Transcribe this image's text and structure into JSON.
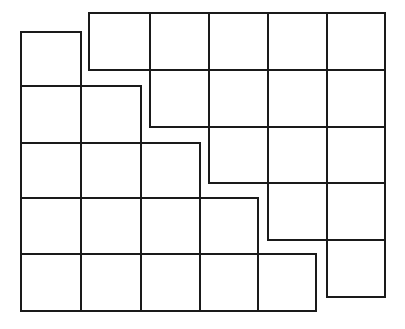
{
  "figure": {
    "kind": "staircase-grid-diagram",
    "width": 405,
    "height": 329,
    "background_color": "#ffffff",
    "stroke_color": "#1a1a1a",
    "stroke_width": 2.6,
    "cell_fill": "#ffffff",
    "row_count": 5,
    "column_count": 6,
    "cell_count": 30,
    "lower_block": {
      "name": "lower-left-staircase-block",
      "cells_per_row": [
        1,
        2,
        3,
        4,
        5
      ],
      "column_x_edges": [
        21,
        81,
        141,
        200,
        258,
        316
      ],
      "row_y_edges": [
        32,
        86,
        143,
        198,
        254,
        311
      ]
    },
    "upper_block": {
      "name": "upper-right-staircase-block",
      "cells_per_row": [
        5,
        4,
        3,
        2,
        1
      ],
      "column_x_edges": [
        89,
        150,
        209,
        268,
        327,
        385
      ],
      "row_y_edges": [
        13,
        70,
        127,
        183,
        240,
        297
      ]
    },
    "cells": [
      {
        "id": "lower-r1-c1",
        "block": "lower",
        "row": 1,
        "col": 1,
        "x": 21,
        "y": 32,
        "w": 60,
        "h": 54
      },
      {
        "id": "lower-r2-c1",
        "block": "lower",
        "row": 2,
        "col": 1,
        "x": 21,
        "y": 86,
        "w": 60,
        "h": 57
      },
      {
        "id": "lower-r2-c2",
        "block": "lower",
        "row": 2,
        "col": 2,
        "x": 81,
        "y": 86,
        "w": 60,
        "h": 57
      },
      {
        "id": "lower-r3-c1",
        "block": "lower",
        "row": 3,
        "col": 1,
        "x": 21,
        "y": 143,
        "w": 60,
        "h": 55
      },
      {
        "id": "lower-r3-c2",
        "block": "lower",
        "row": 3,
        "col": 2,
        "x": 81,
        "y": 143,
        "w": 60,
        "h": 55
      },
      {
        "id": "lower-r3-c3",
        "block": "lower",
        "row": 3,
        "col": 3,
        "x": 141,
        "y": 143,
        "w": 59,
        "h": 55
      },
      {
        "id": "lower-r4-c1",
        "block": "lower",
        "row": 4,
        "col": 1,
        "x": 21,
        "y": 198,
        "w": 60,
        "h": 56
      },
      {
        "id": "lower-r4-c2",
        "block": "lower",
        "row": 4,
        "col": 2,
        "x": 81,
        "y": 198,
        "w": 60,
        "h": 56
      },
      {
        "id": "lower-r4-c3",
        "block": "lower",
        "row": 4,
        "col": 3,
        "x": 141,
        "y": 198,
        "w": 59,
        "h": 56
      },
      {
        "id": "lower-r4-c4",
        "block": "lower",
        "row": 4,
        "col": 4,
        "x": 200,
        "y": 198,
        "w": 58,
        "h": 56
      },
      {
        "id": "lower-r5-c1",
        "block": "lower",
        "row": 5,
        "col": 1,
        "x": 21,
        "y": 254,
        "w": 60,
        "h": 57
      },
      {
        "id": "lower-r5-c2",
        "block": "lower",
        "row": 5,
        "col": 2,
        "x": 81,
        "y": 254,
        "w": 60,
        "h": 57
      },
      {
        "id": "lower-r5-c3",
        "block": "lower",
        "row": 5,
        "col": 3,
        "x": 141,
        "y": 254,
        "w": 59,
        "h": 57
      },
      {
        "id": "lower-r5-c4",
        "block": "lower",
        "row": 5,
        "col": 4,
        "x": 200,
        "y": 254,
        "w": 58,
        "h": 57
      },
      {
        "id": "lower-r5-c5",
        "block": "lower",
        "row": 5,
        "col": 5,
        "x": 258,
        "y": 254,
        "w": 58,
        "h": 57
      },
      {
        "id": "upper-r1-c2",
        "block": "upper",
        "row": 1,
        "col": 2,
        "x": 89,
        "y": 13,
        "w": 61,
        "h": 57
      },
      {
        "id": "upper-r1-c3",
        "block": "upper",
        "row": 1,
        "col": 3,
        "x": 150,
        "y": 13,
        "w": 59,
        "h": 57
      },
      {
        "id": "upper-r1-c4",
        "block": "upper",
        "row": 1,
        "col": 4,
        "x": 209,
        "y": 13,
        "w": 59,
        "h": 57
      },
      {
        "id": "upper-r1-c5",
        "block": "upper",
        "row": 1,
        "col": 5,
        "x": 268,
        "y": 13,
        "w": 59,
        "h": 57
      },
      {
        "id": "upper-r1-c6",
        "block": "upper",
        "row": 1,
        "col": 6,
        "x": 327,
        "y": 13,
        "w": 58,
        "h": 57
      },
      {
        "id": "upper-r2-c3",
        "block": "upper",
        "row": 2,
        "col": 3,
        "x": 150,
        "y": 70,
        "w": 59,
        "h": 57
      },
      {
        "id": "upper-r2-c4",
        "block": "upper",
        "row": 2,
        "col": 4,
        "x": 209,
        "y": 70,
        "w": 59,
        "h": 57
      },
      {
        "id": "upper-r2-c5",
        "block": "upper",
        "row": 2,
        "col": 5,
        "x": 268,
        "y": 70,
        "w": 59,
        "h": 57
      },
      {
        "id": "upper-r2-c6",
        "block": "upper",
        "row": 2,
        "col": 6,
        "x": 327,
        "y": 70,
        "w": 58,
        "h": 57
      },
      {
        "id": "upper-r3-c4",
        "block": "upper",
        "row": 3,
        "col": 4,
        "x": 209,
        "y": 127,
        "w": 59,
        "h": 56
      },
      {
        "id": "upper-r3-c5",
        "block": "upper",
        "row": 3,
        "col": 5,
        "x": 268,
        "y": 127,
        "w": 59,
        "h": 56
      },
      {
        "id": "upper-r3-c6",
        "block": "upper",
        "row": 3,
        "col": 6,
        "x": 327,
        "y": 127,
        "w": 58,
        "h": 56
      },
      {
        "id": "upper-r4-c5",
        "block": "upper",
        "row": 4,
        "col": 5,
        "x": 268,
        "y": 183,
        "w": 59,
        "h": 57
      },
      {
        "id": "upper-r4-c6",
        "block": "upper",
        "row": 4,
        "col": 6,
        "x": 327,
        "y": 183,
        "w": 58,
        "h": 57
      },
      {
        "id": "upper-r5-c6",
        "block": "upper",
        "row": 5,
        "col": 6,
        "x": 327,
        "y": 240,
        "w": 58,
        "h": 57
      }
    ]
  }
}
